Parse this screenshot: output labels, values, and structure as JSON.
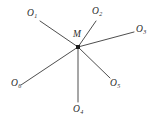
{
  "figure": {
    "type": "star-diagram",
    "background_color": "#ffffff",
    "line_color": "#3a3a3a",
    "text_color": "#2b2b2b",
    "center": {
      "label": "M",
      "sub": "",
      "x": 78,
      "y": 47,
      "marker": "filled-square"
    },
    "points": [
      {
        "id": "o1",
        "label": "O",
        "sub": "1",
        "label_x": 27,
        "label_y": 9,
        "end_x": 40,
        "end_y": 21
      },
      {
        "id": "o2",
        "label": "O",
        "sub": "2",
        "label_x": 92,
        "label_y": 7,
        "end_x": 96,
        "end_y": 21
      },
      {
        "id": "o3",
        "label": "O",
        "sub": "3",
        "label_x": 136,
        "label_y": 25,
        "end_x": 134,
        "end_y": 32
      },
      {
        "id": "o5",
        "label": "O",
        "sub": "5",
        "label_x": 110,
        "label_y": 79,
        "end_x": 110,
        "end_y": 78
      },
      {
        "id": "o4",
        "label": "O",
        "sub": "4",
        "label_x": 73,
        "label_y": 105,
        "end_x": 78,
        "end_y": 102
      },
      {
        "id": "o6",
        "label": "O",
        "sub": "6",
        "label_x": 11,
        "label_y": 79,
        "end_x": 21,
        "end_y": 85
      }
    ]
  }
}
